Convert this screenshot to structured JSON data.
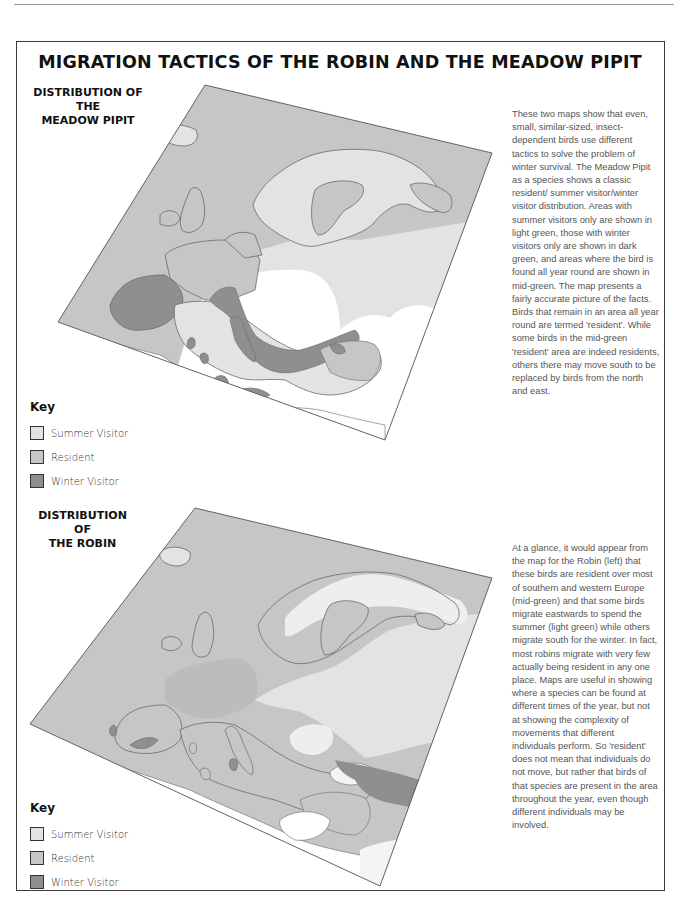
{
  "page": {
    "title": "MIGRATION TACTICS OF THE ROBIN AND THE MEADOW PIPIT"
  },
  "colors": {
    "summer_visitor": "#e3e3e3",
    "resident": "#c6c6c6",
    "winter_visitor": "#8f8f8f",
    "sea": "#c6c6c6",
    "outside": "#ffffff",
    "coastline": "#6a6a6a"
  },
  "maps": [
    {
      "id": "meadow-pipit",
      "title_line1": "DISTRIBUTION OF THE",
      "title_line2": "MEADOW PIPIT",
      "key": {
        "title": "Key",
        "items": [
          {
            "label": "Summer Visitor",
            "category": "summer_visitor"
          },
          {
            "label": "Resident",
            "category": "resident"
          },
          {
            "label": "Winter Visitor",
            "category": "winter_visitor"
          }
        ]
      },
      "regions": {
        "summer_visitor": [
          "Iceland",
          "Scandinavia",
          "Eastern Europe / Russia"
        ],
        "resident": [
          "British Isles",
          "France",
          "Low Countries",
          "Baltic"
        ],
        "winter_visitor": [
          "Iberia",
          "Italy",
          "Balkans",
          "Mediterranean islands",
          "Crimea"
        ]
      }
    },
    {
      "id": "robin",
      "title_line1": "DISTRIBUTION OF",
      "title_line2": "THE ROBIN",
      "key": {
        "title": "Key",
        "items": [
          {
            "label": "Summer Visitor",
            "category": "summer_visitor"
          },
          {
            "label": "Resident",
            "category": "resident"
          },
          {
            "label": "Winter Visitor",
            "category": "winter_visitor"
          }
        ]
      },
      "regions": {
        "summer_visitor": [
          "Northern Scandinavia",
          "Eastern Europe / Russia"
        ],
        "resident": [
          "Western Europe",
          "Southern Europe",
          "British Isles"
        ],
        "winter_visitor": [
          "Southern Iberia",
          "Caucasus / South-east"
        ]
      }
    }
  ],
  "texts": {
    "pipit_paragraph": "These two maps show that even, small, similar-sized, insect-dependent birds use different tactics to solve the problem of winter survival. The Meadow Pipit as a species shows a classic resident/ summer visitor/winter visitor distribution. Areas with summer visitors only are shown in light green, those with winter visitors only are shown in dark green, and areas where the bird is found all year round are shown in mid-green. The map presents a fairly accurate picture of the facts. Birds that remain in an area all year round are termed 'resident'. While some birds in the mid-green 'resident' area are indeed residents, others there may move south to be replaced by birds from the north and east.",
    "robin_paragraph": "At a glance, it would appear from the map for the Robin (left) that these birds are resident over most of southern and western Europe (mid-green) and that some birds migrate eastwards to spend the summer (light green) while others migrate south for the winter. In fact, most robins migrate with very few actually being resident in any one place. Maps are useful in showing where a species can be found at different times of the year, but not at showing the complexity of movements that different individuals perform. So 'resident' does not mean that individuals do not move, but rather that birds of that species are present in the area throughout the year, even though different individuals may be involved."
  }
}
